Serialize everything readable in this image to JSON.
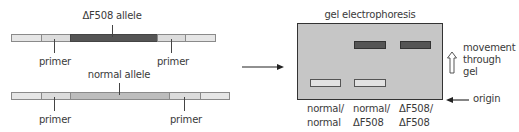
{
  "figure": {
    "top_strand": {
      "label": "ΔF508 allele",
      "primer_left": "primer",
      "primer_right": "primer"
    },
    "bottom_strand": {
      "label": "normal allele",
      "primer_left": "primer",
      "primer_right": "primer"
    },
    "gel": {
      "title": "gel electrophoresis",
      "direction_label": [
        "movement",
        "through",
        "gel"
      ],
      "origin_label": "origin",
      "lanes": [
        {
          "label_line1": "normal/",
          "label_line2": "normal",
          "bands": [
            "normal"
          ]
        },
        {
          "label_line1": "normal/",
          "label_line2": "ΔF508",
          "bands": [
            "normal",
            "ΔF508"
          ]
        },
        {
          "label_line1": "ΔF508/",
          "label_line2": "ΔF508",
          "bands": [
            "ΔF508"
          ]
        }
      ]
    },
    "colors": {
      "flank": "#e6e6e6",
      "primer": "#dcdcdc",
      "mutant_allele": "#555555",
      "normal_allele": "#bdbdbd",
      "gel": "#c6c6c6",
      "outline": "#8a8a8a"
    }
  }
}
